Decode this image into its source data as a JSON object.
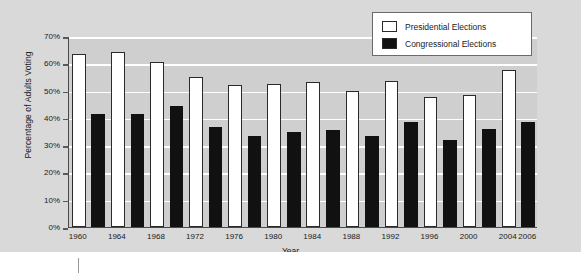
{
  "chart_data": {
    "type": "bar",
    "title": "",
    "xlabel": "Year",
    "ylabel": "Percentage of Adults Voting",
    "ylim": [
      0,
      70
    ],
    "ytick_values": [
      0,
      10,
      20,
      30,
      40,
      50,
      60,
      70
    ],
    "ytick_labels": [
      "0%",
      "10%",
      "20%",
      "30%",
      "40%",
      "50%",
      "60%",
      "70%"
    ],
    "grid": true,
    "legend_position": "top-right",
    "legend": [
      {
        "name": "Presidential Elections",
        "color": "#ffffff"
      },
      {
        "name": "Congressional Elections",
        "color": "#111111"
      }
    ],
    "xtick_labels": [
      "1960",
      "1964",
      "1968",
      "1972",
      "1976",
      "1980",
      "1984",
      "1988",
      "1992",
      "1996",
      "2000",
      "2004",
      "2006"
    ],
    "bars": [
      {
        "label": "1960",
        "series": "Presidential Elections",
        "value": 63.5
      },
      {
        "label": "1962",
        "series": "Congressional Elections",
        "value": 41.5
      },
      {
        "label": "1964",
        "series": "Presidential Elections",
        "value": 64.0
      },
      {
        "label": "1966",
        "series": "Congressional Elections",
        "value": 41.5
      },
      {
        "label": "1968",
        "series": "Presidential Elections",
        "value": 60.5
      },
      {
        "label": "1970",
        "series": "Congressional Elections",
        "value": 44.5
      },
      {
        "label": "1972",
        "series": "Presidential Elections",
        "value": 55.0
      },
      {
        "label": "1974",
        "series": "Congressional Elections",
        "value": 36.5
      },
      {
        "label": "1976",
        "series": "Presidential Elections",
        "value": 52.0
      },
      {
        "label": "1978",
        "series": "Congressional Elections",
        "value": 33.5
      },
      {
        "label": "1980",
        "series": "Presidential Elections",
        "value": 52.5
      },
      {
        "label": "1982",
        "series": "Congressional Elections",
        "value": 35.0
      },
      {
        "label": "1984",
        "series": "Presidential Elections",
        "value": 53.0
      },
      {
        "label": "1986",
        "series": "Congressional Elections",
        "value": 35.5
      },
      {
        "label": "1988",
        "series": "Presidential Elections",
        "value": 50.0
      },
      {
        "label": "1990",
        "series": "Congressional Elections",
        "value": 33.5
      },
      {
        "label": "1992",
        "series": "Presidential Elections",
        "value": 53.5
      },
      {
        "label": "1994",
        "series": "Congressional Elections",
        "value": 38.5
      },
      {
        "label": "1996",
        "series": "Presidential Elections",
        "value": 47.5
      },
      {
        "label": "1998",
        "series": "Congressional Elections",
        "value": 32.0
      },
      {
        "label": "2000",
        "series": "Presidential Elections",
        "value": 48.5
      },
      {
        "label": "2002",
        "series": "Congressional Elections",
        "value": 36.0
      },
      {
        "label": "2004",
        "series": "Presidential Elections",
        "value": 57.5
      },
      {
        "label": "2006",
        "series": "Congressional Elections",
        "value": 38.5
      }
    ]
  },
  "colors": {
    "figure_background": "#d9d9d9",
    "plot_background": "#cfcfcf",
    "gridline": "#ffffff",
    "axis": "#4a4a4a",
    "presidential": "#ffffff",
    "congressional": "#111111",
    "text": "#1a1a1a"
  }
}
